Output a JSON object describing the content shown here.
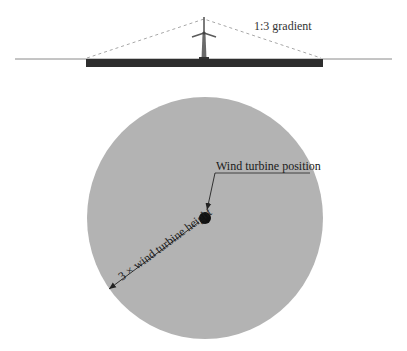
{
  "diagram": {
    "elevation_view": {
      "gradient_label": "1:3 gradient",
      "ground_line": {
        "x1": 15,
        "x2": 392,
        "y": 59,
        "color": "#8a8a8a"
      },
      "base_bar": {
        "x": 86,
        "y": 59,
        "width": 237,
        "height": 8,
        "color": "#2e2e2e"
      },
      "dashed_slope": {
        "left": [
          87,
          58
        ],
        "apex": [
          204,
          19
        ],
        "right": [
          321,
          58
        ],
        "color": "#a8a8a8"
      },
      "turbine": {
        "hub": [
          204,
          33
        ],
        "tip": [
          204,
          17
        ],
        "base_y": 59,
        "color": "#6a6a6a"
      }
    },
    "plan_view": {
      "circle": {
        "cx": 205,
        "cy": 218,
        "rx": 118,
        "ry": 121,
        "fill": "#b3b3b3"
      },
      "turbine_dot": {
        "cx": 205,
        "cy": 218,
        "r": 6,
        "fill": "#111111"
      },
      "position_label": "Wind turbine position",
      "radius_label": "3 × wind turbine height"
    }
  }
}
